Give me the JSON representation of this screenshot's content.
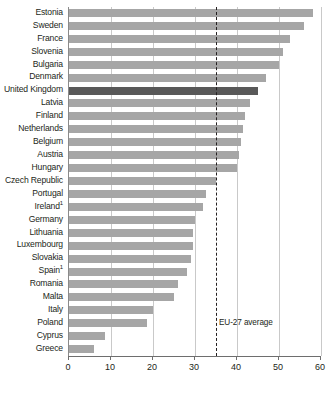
{
  "chart_data": {
    "type": "bar",
    "orientation": "horizontal",
    "title": "",
    "subtitle": "",
    "xlabel": "",
    "ylabel": "",
    "xlim": [
      0,
      60
    ],
    "xticks": [
      0,
      10,
      20,
      30,
      40,
      50,
      60
    ],
    "xtick_labels": [
      "0",
      "10",
      "20",
      "30",
      "40",
      "50",
      "60"
    ],
    "grid": true,
    "grid_axis": "x",
    "legend": "none",
    "categories": [
      "Estonia",
      "Sweden",
      "France",
      "Slovenia",
      "Bulgaria",
      "Denmark",
      "United Kingdom",
      "Latvia",
      "Finland",
      "Netherlands",
      "Belgium",
      "Austria",
      "Hungary",
      "Czech Republic",
      "Portugal",
      "Ireland",
      "Germany",
      "Lithuania",
      "Luxembourg",
      "Slovakia",
      "Spain",
      "Romania",
      "Malta",
      "Italy",
      "Poland",
      "Cyprus",
      "Greece"
    ],
    "category_footnotes": {
      "Ireland": "1",
      "Spain": "1"
    },
    "values": [
      58,
      56,
      52.5,
      51,
      50,
      47,
      45,
      43,
      42,
      41.5,
      41,
      40.5,
      40,
      35,
      32.5,
      32,
      30,
      29.5,
      29.5,
      29,
      28,
      26,
      25,
      20,
      18.5,
      8.5,
      6
    ],
    "highlight_category": "United Kingdom",
    "annotations": [
      {
        "name": "eu-27-average",
        "label": "EU-27 average",
        "value": 35,
        "style": "dashed-vertical-line"
      }
    ],
    "colors": {
      "bar": "#a6a6a6",
      "bar_highlight": "#595959",
      "gridline": "#c9c9c9",
      "axis": "#6e6e6e",
      "text": "#231f20",
      "background": "#ffffff"
    }
  }
}
